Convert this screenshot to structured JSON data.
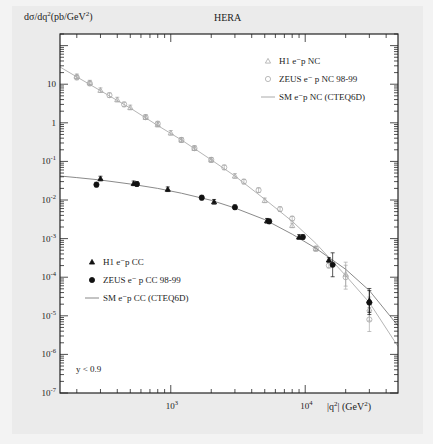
{
  "chart_data": {
    "type": "scatter",
    "title": "HERA",
    "ylabel": "dσ/dq²(pb/GeV²)",
    "xlabel": "|q²| (GeV²)",
    "xscale": "log",
    "yscale": "log",
    "xlim": [
      150,
      49000
    ],
    "ylim": [
      1e-07,
      200
    ],
    "x_tick_labels": [
      "10^3",
      "10^4"
    ],
    "y_tick_labels": [
      "10^-7",
      "10^-6",
      "10^-5",
      "10^-4",
      "10^-3",
      "10^-2",
      "10^-1",
      "1",
      "10"
    ],
    "annotation": "y < 0.9",
    "grid": false,
    "legends": [
      {
        "position": "upper-right",
        "entries": [
          {
            "label": "H1 e⁻p NC",
            "marker": "open-triangle",
            "color": "#aaaaaa"
          },
          {
            "label": "ZEUS e⁻ p NC 98-99",
            "marker": "open-circle",
            "color": "#aaaaaa"
          },
          {
            "label": "SM e⁻p NC (CTEQ6D)",
            "marker": "line",
            "color": "#aaaaaa"
          }
        ]
      },
      {
        "position": "lower-left",
        "entries": [
          {
            "label": "H1 e⁻p CC",
            "marker": "filled-triangle",
            "color": "#111111"
          },
          {
            "label": "ZEUS e⁻ p CC 98-99",
            "marker": "filled-circle",
            "color": "#111111"
          },
          {
            "label": "SM e⁻p CC (CTEQ6D)",
            "marker": "line",
            "color": "#888888"
          }
        ]
      }
    ],
    "series": [
      {
        "name": "SM e⁻p NC (CTEQ6D)",
        "kind": "line",
        "color": "#b5b5b5",
        "x": [
          150,
          200,
          300,
          500,
          800,
          1200,
          2000,
          3000,
          5000,
          8000,
          12000,
          20000,
          30000,
          49000
        ],
        "y": [
          28,
          15.5,
          6.8,
          2.4,
          0.85,
          0.36,
          0.11,
          0.042,
          0.0105,
          0.0028,
          0.00075,
          0.00011,
          2.2e-05,
          1.6e-06
        ]
      },
      {
        "name": "H1 e⁻p NC",
        "kind": "open-triangle",
        "color": "#a8a8a8",
        "x": [
          200,
          250,
          300,
          400,
          500,
          650,
          800,
          1000,
          1200,
          1500,
          2000,
          3000,
          5000,
          8000,
          12000,
          20000,
          30000
        ],
        "y": [
          16,
          11,
          7.0,
          4.0,
          2.5,
          1.4,
          0.9,
          0.55,
          0.36,
          0.22,
          0.11,
          0.042,
          0.0098,
          0.0022,
          0.00055,
          0.00012,
          1.5e-05
        ]
      },
      {
        "name": "ZEUS e⁻ p NC 98-99",
        "kind": "open-circle",
        "color": "#a8a8a8",
        "x": [
          200,
          250,
          350,
          450,
          650,
          800,
          1200,
          1500,
          2000,
          2500,
          3500,
          4500,
          6500,
          8000,
          12000,
          15000,
          20000,
          30000
        ],
        "y": [
          15,
          10.5,
          5.2,
          3.0,
          1.4,
          0.95,
          0.36,
          0.22,
          0.11,
          0.07,
          0.03,
          0.018,
          0.0058,
          0.0033,
          0.00055,
          0.0002,
          0.0001,
          8e-06
        ]
      },
      {
        "name": "SM e⁻p CC (CTEQ6D)",
        "kind": "line",
        "color": "#8a8a8a",
        "x": [
          150,
          200,
          300,
          500,
          800,
          1200,
          2000,
          3000,
          5000,
          8000,
          12000,
          20000,
          30000,
          49000
        ],
        "y": [
          0.042,
          0.038,
          0.033,
          0.026,
          0.02,
          0.015,
          0.0098,
          0.0062,
          0.0031,
          0.0013,
          0.00056,
          0.00016,
          4.5e-05,
          5.5e-06
        ]
      },
      {
        "name": "H1 e⁻p CC",
        "kind": "filled-triangle",
        "color": "#111111",
        "x": [
          300,
          530,
          950,
          2100,
          5200,
          9000,
          15000,
          30000
        ],
        "y": [
          0.036,
          0.027,
          0.019,
          0.009,
          0.0029,
          0.0011,
          0.00028,
          2.5e-05
        ]
      },
      {
        "name": "ZEUS e⁻ p CC 98-99",
        "kind": "filled-circle",
        "color": "#111111",
        "x": [
          280,
          560,
          1700,
          3000,
          5400,
          9600,
          16000,
          30000
        ],
        "y": [
          0.025,
          0.026,
          0.0115,
          0.0065,
          0.0028,
          0.0011,
          0.00021,
          2.2e-05
        ]
      }
    ]
  }
}
